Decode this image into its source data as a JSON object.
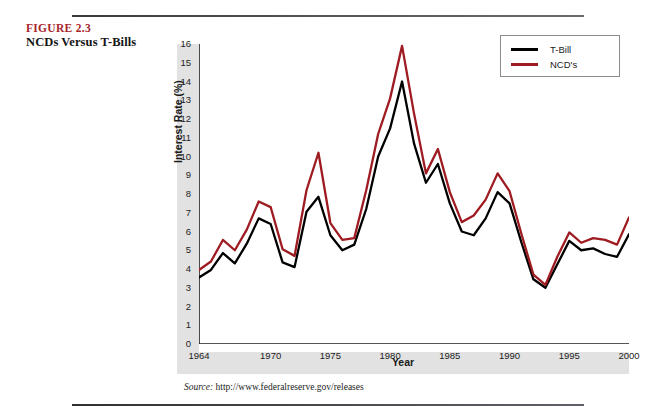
{
  "figure": {
    "number": "FIGURE 2.3",
    "caption": "NCDs Versus T-Bills",
    "source_prefix": "Source:",
    "source_url": "http://www.federalreserve.gov/releases"
  },
  "legend": {
    "position": "top-right",
    "entries": [
      {
        "label": "T-Bill",
        "color": "#000000"
      },
      {
        "label": "NCD's",
        "color": "#9e1b22"
      }
    ]
  },
  "colors": {
    "tbill": "#000000",
    "ncd": "#9e1b22",
    "figure_number": "#a8252b",
    "band": "#e2e2e2",
    "axis": "#1c1c1c"
  },
  "chart_data": {
    "type": "line",
    "title": "NCDs Versus T-Bills",
    "xlabel": "Year",
    "ylabel": "Interest Rate (%)",
    "xlim": [
      1964,
      2000
    ],
    "ylim": [
      0,
      16
    ],
    "grid": false,
    "legend_position": "top-right",
    "ytick_labels": [
      "16",
      "15",
      "14",
      "13",
      "12",
      "11",
      "10",
      "9",
      "8",
      "7",
      "6",
      "5",
      "4",
      "3",
      "2",
      "1",
      "0"
    ],
    "ytick_values": [
      16,
      15,
      14,
      13,
      12,
      11,
      10,
      9,
      8,
      7,
      6,
      5,
      4,
      3,
      2,
      1,
      0
    ],
    "xtick_labels": [
      "1964",
      "1970",
      "1975",
      "1980",
      "1985",
      "1990",
      "1995",
      "2000"
    ],
    "xtick_values": [
      1964,
      1970,
      1975,
      1980,
      1985,
      1990,
      1995,
      2000
    ],
    "x": [
      1964,
      1965,
      1966,
      1967,
      1968,
      1969,
      1970,
      1971,
      1972,
      1973,
      1974,
      1975,
      1976,
      1977,
      1978,
      1979,
      1980,
      1981,
      1982,
      1983,
      1984,
      1985,
      1986,
      1987,
      1988,
      1989,
      1990,
      1991,
      1992,
      1993,
      1994,
      1995,
      1996,
      1997,
      1998,
      1999,
      2000
    ],
    "series": [
      {
        "name": "T-Bill",
        "color": "#000000",
        "values": [
          3.55,
          3.95,
          4.85,
          4.3,
          5.35,
          6.7,
          6.4,
          4.35,
          4.1,
          7.05,
          7.85,
          5.8,
          5.0,
          5.3,
          7.2,
          10.0,
          11.5,
          14.0,
          10.7,
          8.6,
          9.6,
          7.5,
          6.0,
          5.8,
          6.7,
          8.1,
          7.5,
          5.4,
          3.45,
          3.0,
          4.25,
          5.5,
          5.0,
          5.1,
          4.8,
          4.65,
          5.85
        ]
      },
      {
        "name": "NCD's",
        "color": "#9e1b22",
        "values": [
          3.95,
          4.4,
          5.55,
          5.0,
          6.1,
          7.6,
          7.3,
          5.05,
          4.7,
          8.2,
          10.2,
          6.45,
          5.55,
          5.65,
          8.2,
          11.2,
          13.1,
          15.9,
          12.3,
          9.1,
          10.4,
          8.1,
          6.5,
          6.85,
          7.7,
          9.1,
          8.15,
          5.85,
          3.7,
          3.15,
          4.65,
          5.95,
          5.4,
          5.65,
          5.55,
          5.3,
          6.75
        ]
      }
    ]
  }
}
